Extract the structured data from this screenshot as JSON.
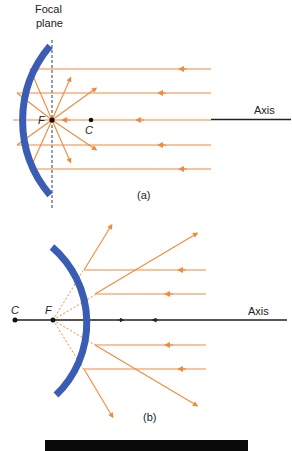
{
  "figure_a": {
    "focal_plane_label_line1": "Focal",
    "focal_plane_label_line2": "plane",
    "focus_label": "F",
    "center_label": "C",
    "axis_label": "Axis",
    "caption": "(a)",
    "mirror_type": "concave",
    "colors": {
      "mirror": "#3b5cb4",
      "ray": "#f08a3c",
      "axis": "#222222"
    }
  },
  "figure_b": {
    "focus_label": "F",
    "center_label": "C",
    "axis_label": "Axis",
    "caption": "(b)",
    "mirror_type": "convex",
    "colors": {
      "mirror": "#3b5cb4",
      "ray": "#f08a3c",
      "axis": "#222222"
    }
  }
}
